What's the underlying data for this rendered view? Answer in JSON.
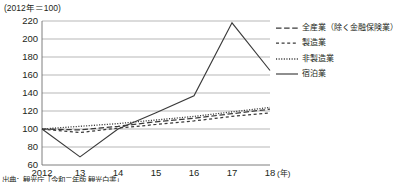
{
  "chart_data": {
    "type": "line",
    "title": "",
    "unit_label": "(2012年＝100)",
    "xlabel": "(年)",
    "ylabel": "",
    "x": [
      "2012",
      "13",
      "14",
      "15",
      "16",
      "17",
      "18"
    ],
    "categories": [
      "2012",
      "13",
      "14",
      "15",
      "16",
      "17",
      "18"
    ],
    "xtick_labels": [
      "2012",
      "13",
      "14",
      "15",
      "16",
      "17",
      "18"
    ],
    "ytick_labels": [
      "220",
      "200",
      "180",
      "160",
      "140",
      "120",
      "100",
      "80",
      "60"
    ],
    "ylim": [
      60,
      220
    ],
    "ytick_step": 20,
    "grid": true,
    "legend_position": "right",
    "series": [
      {
        "name": "全産業（除く金融保険業）",
        "style": "long-dash",
        "color": "#3a3a3a",
        "values": [
          100,
          99,
          103,
          108,
          112,
          117,
          122
        ]
      },
      {
        "name": "製造業",
        "style": "short-dash",
        "color": "#3a3a3a",
        "values": [
          100,
          96,
          101,
          105,
          109,
          114,
          118
        ]
      },
      {
        "name": "非製造業",
        "style": "dotted",
        "color": "#3a3a3a",
        "values": [
          100,
          103,
          106,
          110,
          114,
          119,
          124
        ]
      },
      {
        "name": "宿泊業",
        "style": "solid",
        "color": "#3a3a3a",
        "values": [
          100,
          69,
          100,
          118,
          137,
          218,
          165
        ]
      }
    ]
  },
  "legend": {
    "items": [
      {
        "label": "全産業（除く金融保険業）",
        "style": "long-dash"
      },
      {
        "label": "製造業",
        "style": "short-dash"
      },
      {
        "label": "非製造業",
        "style": "dotted"
      },
      {
        "label": "宿泊業",
        "style": "solid"
      }
    ]
  },
  "source": {
    "note": "出典：観光庁「令和二年版 観光白書」"
  }
}
